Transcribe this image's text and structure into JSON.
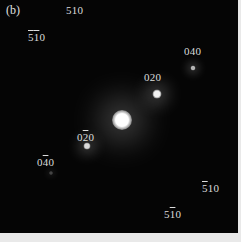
{
  "figure": {
    "panel_label": "(b)",
    "colors": {
      "background": "#050505",
      "spot": "#ffffff",
      "label": "#dcdcdc",
      "frame": "#e9e9e9"
    }
  },
  "spots": [
    {
      "name": "central-beam-spot",
      "x": 122,
      "y": 120,
      "size": 20,
      "glow": 34,
      "intensity": 1.0
    },
    {
      "name": "spot-020",
      "x": 157,
      "y": 94,
      "size": 9,
      "glow": 18,
      "intensity": 0.95
    },
    {
      "name": "spot-040",
      "x": 193,
      "y": 68,
      "size": 5,
      "glow": 10,
      "intensity": 0.7
    },
    {
      "name": "spot-0-20",
      "x": 87,
      "y": 146,
      "size": 7,
      "glow": 14,
      "intensity": 0.85
    },
    {
      "name": "spot-0-40",
      "x": 51,
      "y": 173,
      "size": 4,
      "glow": 6,
      "intensity": 0.25
    }
  ],
  "labels": [
    {
      "name": "label-510",
      "x": 66,
      "y": 4,
      "parts": [
        [
          "5",
          false
        ],
        [
          "1",
          false
        ],
        [
          "0",
          false
        ]
      ]
    },
    {
      "name": "label-5bar1bar0",
      "x": 28,
      "y": 31,
      "parts": [
        [
          "5",
          true
        ],
        [
          "1",
          true
        ],
        [
          "0",
          false
        ]
      ]
    },
    {
      "name": "label-040",
      "x": 184,
      "y": 45,
      "parts": [
        [
          "0",
          false
        ],
        [
          "4",
          false
        ],
        [
          "0",
          false
        ]
      ]
    },
    {
      "name": "label-020",
      "x": 144,
      "y": 71,
      "parts": [
        [
          "0",
          false
        ],
        [
          "2",
          false
        ],
        [
          "0",
          false
        ]
      ]
    },
    {
      "name": "label-02bar0",
      "x": 77,
      "y": 131,
      "parts": [
        [
          "0",
          false
        ],
        [
          "2",
          true
        ],
        [
          "0",
          false
        ]
      ]
    },
    {
      "name": "label-04bar0",
      "x": 37,
      "y": 156,
      "parts": [
        [
          "0",
          false
        ],
        [
          "4",
          true
        ],
        [
          "0",
          false
        ]
      ]
    },
    {
      "name": "label-5bar10",
      "x": 202,
      "y": 182,
      "parts": [
        [
          "5",
          true
        ],
        [
          "1",
          false
        ],
        [
          "0",
          false
        ]
      ]
    },
    {
      "name": "label-51bar0",
      "x": 164,
      "y": 208,
      "parts": [
        [
          "5",
          false
        ],
        [
          "1",
          true
        ],
        [
          "0",
          false
        ]
      ]
    }
  ]
}
